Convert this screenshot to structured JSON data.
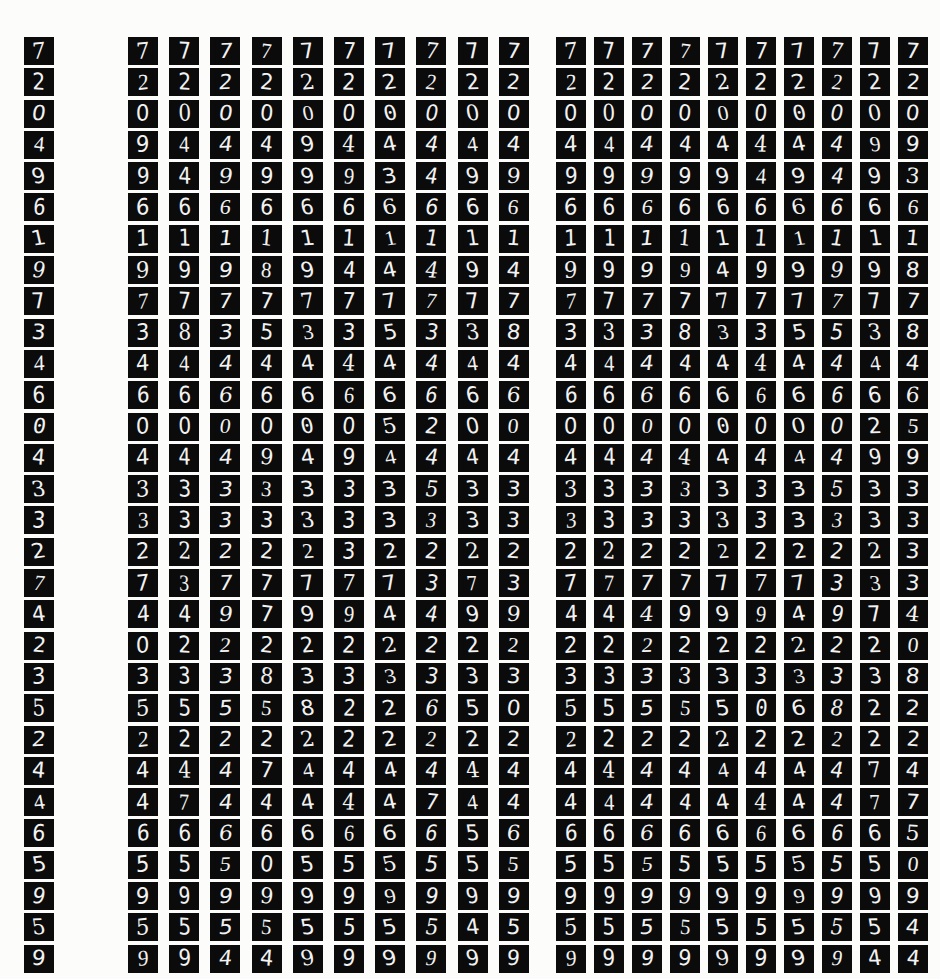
{
  "figure": {
    "kind": "mnist-digit-grid",
    "background_color": "#fcfcfa",
    "cell_background_color": "#0b0b0b",
    "stroke_color": "#f2f2f2",
    "rows": 30,
    "panels": [
      {
        "name": "reference-column",
        "columns": 1,
        "description": "single reference digit per row"
      },
      {
        "name": "samples-a",
        "columns": 10,
        "description": "ten sampled reconstructions per row"
      },
      {
        "name": "samples-b",
        "columns": 10,
        "description": "ten sampled reconstructions per row"
      }
    ]
  },
  "reference": {
    "labels": [
      7,
      2,
      0,
      4,
      9,
      6,
      1,
      9,
      7,
      3,
      4,
      6,
      0,
      4,
      3,
      3,
      2,
      7,
      4,
      2,
      3,
      5,
      2,
      4,
      4,
      6,
      5,
      9,
      5,
      9
    ]
  },
  "samples_a": {
    "rows": [
      [
        7,
        7,
        7,
        7,
        7,
        7,
        7,
        7,
        7,
        7
      ],
      [
        2,
        2,
        2,
        2,
        2,
        2,
        2,
        2,
        2,
        2
      ],
      [
        0,
        0,
        0,
        0,
        0,
        0,
        0,
        0,
        0,
        0
      ],
      [
        9,
        4,
        4,
        4,
        9,
        4,
        4,
        4,
        4,
        4
      ],
      [
        9,
        4,
        9,
        9,
        9,
        9,
        3,
        4,
        9,
        9
      ],
      [
        6,
        6,
        6,
        6,
        6,
        6,
        6,
        6,
        6,
        6
      ],
      [
        1,
        1,
        1,
        1,
        1,
        1,
        1,
        1,
        1,
        1
      ],
      [
        9,
        9,
        9,
        8,
        9,
        4,
        4,
        4,
        9,
        4
      ],
      [
        7,
        7,
        7,
        7,
        7,
        7,
        7,
        7,
        7,
        7
      ],
      [
        3,
        8,
        3,
        5,
        3,
        3,
        5,
        3,
        3,
        8
      ],
      [
        4,
        4,
        4,
        4,
        4,
        4,
        4,
        4,
        4,
        4
      ],
      [
        6,
        6,
        6,
        6,
        6,
        6,
        6,
        6,
        6,
        6
      ],
      [
        0,
        0,
        0,
        0,
        0,
        0,
        5,
        2,
        0,
        0
      ],
      [
        4,
        4,
        4,
        9,
        4,
        9,
        4,
        4,
        4,
        4
      ],
      [
        3,
        3,
        3,
        3,
        3,
        3,
        3,
        5,
        3,
        3
      ],
      [
        3,
        3,
        3,
        3,
        3,
        3,
        3,
        3,
        3,
        3
      ],
      [
        2,
        2,
        2,
        2,
        2,
        3,
        2,
        2,
        2,
        2
      ],
      [
        7,
        3,
        7,
        7,
        7,
        7,
        7,
        3,
        7,
        3
      ],
      [
        4,
        4,
        9,
        7,
        9,
        9,
        4,
        4,
        9,
        9
      ],
      [
        0,
        2,
        2,
        2,
        2,
        2,
        2,
        2,
        2,
        2
      ],
      [
        3,
        3,
        3,
        8,
        3,
        3,
        3,
        3,
        3,
        3
      ],
      [
        5,
        5,
        5,
        5,
        8,
        2,
        2,
        6,
        5,
        0
      ],
      [
        2,
        2,
        2,
        2,
        2,
        2,
        2,
        2,
        2,
        2
      ],
      [
        4,
        4,
        4,
        7,
        4,
        4,
        4,
        4,
        4,
        4
      ],
      [
        4,
        7,
        4,
        4,
        4,
        4,
        4,
        7,
        4,
        4
      ],
      [
        6,
        6,
        6,
        6,
        6,
        6,
        6,
        6,
        5,
        6
      ],
      [
        5,
        5,
        5,
        0,
        5,
        5,
        5,
        5,
        5,
        5
      ],
      [
        9,
        9,
        9,
        9,
        9,
        9,
        9,
        9,
        9,
        9
      ],
      [
        5,
        5,
        5,
        5,
        5,
        5,
        5,
        5,
        4,
        5
      ],
      [
        9,
        9,
        4,
        4,
        9,
        9,
        9,
        9,
        9,
        9
      ]
    ]
  },
  "samples_b": {
    "rows": [
      [
        7,
        7,
        7,
        7,
        7,
        7,
        7,
        7,
        7,
        7
      ],
      [
        2,
        2,
        2,
        2,
        2,
        2,
        2,
        2,
        2,
        2
      ],
      [
        0,
        0,
        0,
        0,
        0,
        0,
        0,
        0,
        0,
        0
      ],
      [
        4,
        4,
        4,
        4,
        4,
        4,
        4,
        4,
        9,
        9
      ],
      [
        9,
        9,
        9,
        9,
        9,
        4,
        9,
        4,
        9,
        3
      ],
      [
        6,
        6,
        6,
        6,
        6,
        6,
        6,
        6,
        6,
        6
      ],
      [
        1,
        1,
        1,
        1,
        1,
        1,
        1,
        1,
        1,
        1
      ],
      [
        9,
        9,
        9,
        9,
        4,
        9,
        9,
        9,
        9,
        8
      ],
      [
        7,
        7,
        7,
        7,
        7,
        7,
        7,
        7,
        7,
        7
      ],
      [
        3,
        3,
        3,
        8,
        3,
        3,
        5,
        5,
        3,
        8
      ],
      [
        4,
        4,
        4,
        4,
        4,
        4,
        4,
        4,
        4,
        4
      ],
      [
        6,
        6,
        6,
        6,
        6,
        6,
        6,
        6,
        6,
        6
      ],
      [
        0,
        0,
        0,
        0,
        0,
        0,
        0,
        0,
        2,
        5
      ],
      [
        4,
        4,
        4,
        4,
        4,
        4,
        4,
        4,
        9,
        9
      ],
      [
        3,
        3,
        3,
        3,
        3,
        3,
        3,
        5,
        3,
        3
      ],
      [
        3,
        3,
        3,
        3,
        3,
        3,
        3,
        3,
        3,
        3
      ],
      [
        2,
        2,
        2,
        2,
        2,
        2,
        2,
        2,
        2,
        3
      ],
      [
        7,
        7,
        7,
        7,
        7,
        7,
        7,
        3,
        3,
        3
      ],
      [
        4,
        4,
        4,
        9,
        9,
        9,
        4,
        9,
        7,
        4
      ],
      [
        2,
        2,
        2,
        2,
        2,
        2,
        2,
        2,
        2,
        0
      ],
      [
        3,
        3,
        3,
        3,
        3,
        3,
        3,
        3,
        3,
        8
      ],
      [
        5,
        5,
        5,
        5,
        5,
        0,
        6,
        8,
        2,
        2
      ],
      [
        2,
        2,
        2,
        2,
        2,
        2,
        2,
        2,
        2,
        2
      ],
      [
        4,
        4,
        4,
        4,
        4,
        4,
        4,
        4,
        7,
        4
      ],
      [
        4,
        4,
        4,
        4,
        4,
        4,
        4,
        4,
        7,
        7
      ],
      [
        6,
        6,
        6,
        6,
        6,
        6,
        6,
        6,
        6,
        5
      ],
      [
        5,
        5,
        5,
        5,
        5,
        5,
        5,
        5,
        5,
        0
      ],
      [
        9,
        9,
        9,
        9,
        9,
        9,
        9,
        9,
        9,
        9
      ],
      [
        5,
        5,
        5,
        5,
        5,
        5,
        5,
        5,
        5,
        4
      ],
      [
        9,
        9,
        9,
        9,
        9,
        9,
        9,
        9,
        4,
        4
      ]
    ]
  }
}
